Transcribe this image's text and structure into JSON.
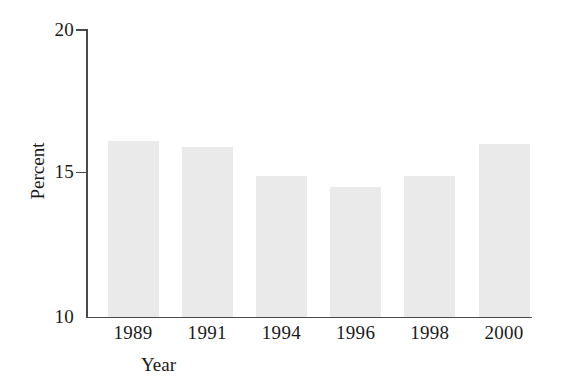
{
  "chart_data": {
    "type": "bar",
    "title": "",
    "subtitle": "",
    "xlabel": "Year",
    "ylabel": "Percent",
    "categories": [
      "1989",
      "1991",
      "1994",
      "1996",
      "1998",
      "2000"
    ],
    "values": [
      16.1,
      15.9,
      14.9,
      14.5,
      14.9,
      16.0
    ],
    "series": [
      {
        "name": "Percent",
        "values": [
          16.1,
          15.9,
          14.9,
          14.5,
          14.9,
          16.0
        ]
      }
    ],
    "ylim": [
      10,
      20
    ],
    "xlim": [
      0,
      6
    ],
    "y_ticks": [
      10,
      15,
      20
    ],
    "y_tick_labels": [
      "10",
      "15",
      "20"
    ],
    "x_tick_labels": [
      "1989",
      "1991",
      "1994",
      "1996",
      "1998",
      "2000"
    ],
    "grid": false,
    "legend": false,
    "legend_position": "none",
    "bar_color": "#eaeaea",
    "axis_color": "#4a4a4a",
    "text_color": "#1a1a1a",
    "background_color": "#ffffff",
    "annotations": []
  },
  "axes": {
    "y_title": "Percent",
    "x_title": "Year",
    "y_tick_20": "20",
    "y_tick_15": "15",
    "y_tick_10": "10"
  }
}
